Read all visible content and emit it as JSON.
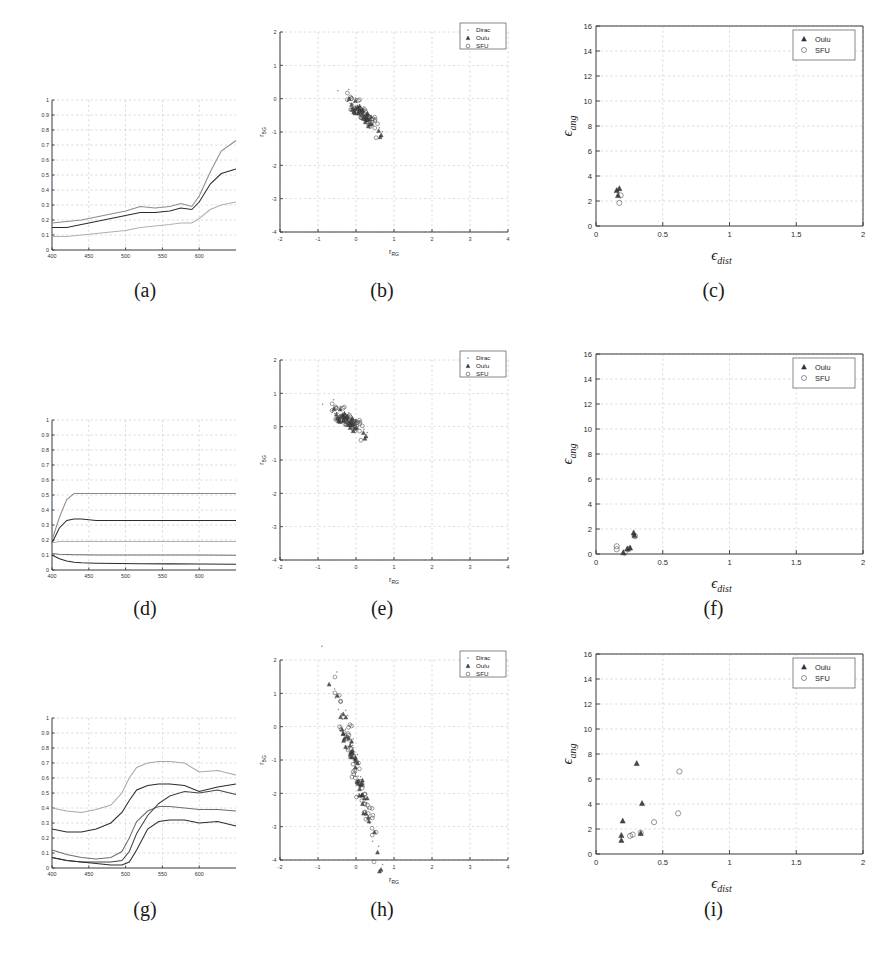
{
  "figure": {
    "rows": 3,
    "cols": 3,
    "captions": [
      "(a)",
      "(b)",
      "(c)",
      "(d)",
      "(e)",
      "(f)",
      "(g)",
      "(h)",
      "(i)"
    ]
  },
  "legends": {
    "scatter_rg": [
      {
        "label": "Dirac",
        "marker": "dot",
        "color": "#808080"
      },
      {
        "label": "Oulu",
        "marker": "triangle",
        "color": "#3a3a3a"
      },
      {
        "label": "SFU",
        "marker": "circle",
        "color": "#4a4a4a"
      }
    ],
    "scatter_eps": [
      {
        "label": "Oulu",
        "marker": "triangle",
        "color": "#3a3a3a"
      },
      {
        "label": "SFU",
        "marker": "circle",
        "color": "#4a4a4a"
      }
    ]
  },
  "axis_labels": {
    "spectral_x": "wavelength",
    "spectral_y": "reflectance",
    "rg_x": "r",
    "rg_x_sub": "RG",
    "rg_y": "r",
    "rg_y_sub": "BG",
    "eps_x": "ϵ",
    "eps_x_sub": "dist",
    "eps_y": "ϵ",
    "eps_y_sub": "ang"
  },
  "colors": {
    "axis": "#3a3a3a",
    "grid": "#9aa7c4",
    "curve_dark": "#2b2b2b",
    "curve_mid": "#6e6e6e",
    "curve_light": "#a8a8a8",
    "background": "#ffffff"
  },
  "chart_data": [
    {
      "id": "a",
      "type": "line",
      "title": "(a)",
      "xlabel": "wavelength (nm)",
      "ylabel": "reflectance",
      "xlim": [
        400,
        650
      ],
      "ylim": [
        0,
        1
      ],
      "xticks": [
        400,
        450,
        500,
        550,
        600
      ],
      "yticks": [
        0,
        0.1,
        0.2,
        0.3,
        0.4,
        0.5,
        0.6,
        0.7,
        0.8,
        0.9,
        1
      ],
      "grid": true,
      "x": [
        400,
        420,
        440,
        460,
        480,
        500,
        520,
        540,
        560,
        575,
        590,
        600,
        615,
        630,
        650
      ],
      "series": [
        {
          "name": "upper",
          "color": "#8c8c8c",
          "values": [
            0.18,
            0.19,
            0.2,
            0.22,
            0.24,
            0.26,
            0.29,
            0.28,
            0.29,
            0.31,
            0.29,
            0.36,
            0.52,
            0.66,
            0.73
          ]
        },
        {
          "name": "middle",
          "color": "#2b2b2b",
          "values": [
            0.15,
            0.15,
            0.17,
            0.19,
            0.21,
            0.23,
            0.25,
            0.25,
            0.26,
            0.28,
            0.27,
            0.32,
            0.44,
            0.51,
            0.54
          ]
        },
        {
          "name": "lower",
          "color": "#b0b0b0",
          "values": [
            0.09,
            0.09,
            0.1,
            0.11,
            0.12,
            0.13,
            0.15,
            0.16,
            0.17,
            0.18,
            0.18,
            0.21,
            0.27,
            0.3,
            0.32
          ]
        }
      ]
    },
    {
      "id": "b",
      "type": "scatter",
      "title": "(b)",
      "xlabel": "r_RG",
      "ylabel": "r_BG",
      "xlim": [
        -2,
        4
      ],
      "ylim": [
        -4,
        2
      ],
      "xticks": [
        -2,
        -1,
        0,
        1,
        2,
        3,
        4
      ],
      "yticks": [
        -4,
        -3,
        -2,
        -1,
        0,
        1,
        2
      ],
      "grid": true,
      "cluster": {
        "x_center": 0.18,
        "y_center": -0.45,
        "x_spread": 0.22,
        "y_spread": 0.33,
        "tilt": -1.25,
        "n_points": 120
      },
      "series": [
        {
          "name": "Dirac",
          "marker": "dot",
          "n": 40
        },
        {
          "name": "Oulu",
          "marker": "triangle",
          "n": 40
        },
        {
          "name": "SFU",
          "marker": "circle",
          "n": 40
        }
      ]
    },
    {
      "id": "c",
      "type": "scatter",
      "title": "(c)",
      "xlabel": "ϵ_dist",
      "ylabel": "ϵ_ang",
      "xlim": [
        0,
        2
      ],
      "ylim": [
        0,
        16
      ],
      "xticks": [
        0,
        0.5,
        1,
        1.5,
        2
      ],
      "yticks": [
        0,
        2,
        4,
        6,
        8,
        10,
        12,
        14,
        16
      ],
      "grid": true,
      "points": [
        {
          "series": "Oulu",
          "x": 0.175,
          "y": 3.0
        },
        {
          "series": "Oulu",
          "x": 0.165,
          "y": 2.45
        },
        {
          "series": "SFU",
          "x": 0.185,
          "y": 2.45
        },
        {
          "series": "SFU",
          "x": 0.175,
          "y": 1.85
        },
        {
          "series": "Oulu",
          "x": 0.155,
          "y": 2.85
        }
      ]
    },
    {
      "id": "d",
      "type": "line",
      "title": "(d)",
      "xlabel": "wavelength (nm)",
      "ylabel": "reflectance",
      "xlim": [
        400,
        650
      ],
      "ylim": [
        0,
        1
      ],
      "xticks": [
        400,
        450,
        500,
        550,
        600
      ],
      "yticks": [
        0,
        0.1,
        0.2,
        0.3,
        0.4,
        0.5,
        0.6,
        0.7,
        0.8,
        0.9,
        1
      ],
      "grid": true,
      "x": [
        400,
        410,
        420,
        430,
        440,
        460,
        490,
        520,
        560,
        600,
        650
      ],
      "series": [
        {
          "name": "s1",
          "color": "#8c8c8c",
          "values": [
            0.2,
            0.35,
            0.47,
            0.51,
            0.51,
            0.51,
            0.51,
            0.51,
            0.51,
            0.51,
            0.51
          ]
        },
        {
          "name": "s2",
          "color": "#2b2b2b",
          "values": [
            0.18,
            0.28,
            0.33,
            0.34,
            0.34,
            0.33,
            0.33,
            0.33,
            0.33,
            0.33,
            0.33
          ]
        },
        {
          "name": "s3",
          "color": "#b0b0b0",
          "values": [
            0.18,
            0.19,
            0.19,
            0.19,
            0.19,
            0.19,
            0.19,
            0.19,
            0.19,
            0.19,
            0.19
          ]
        },
        {
          "name": "s4",
          "color": "#6e6e6e",
          "values": [
            0.11,
            0.105,
            0.103,
            0.102,
            0.101,
            0.1,
            0.1,
            0.1,
            0.1,
            0.1,
            0.099
          ]
        },
        {
          "name": "s5",
          "color": "#2b2b2b",
          "values": [
            0.1,
            0.075,
            0.06,
            0.052,
            0.048,
            0.045,
            0.043,
            0.042,
            0.041,
            0.04,
            0.039
          ]
        }
      ]
    },
    {
      "id": "e",
      "type": "scatter",
      "title": "(e)",
      "xlabel": "r_RG",
      "ylabel": "r_BG",
      "xlim": [
        -2,
        4
      ],
      "ylim": [
        -4,
        2
      ],
      "xticks": [
        -2,
        -1,
        0,
        1,
        2,
        3,
        4
      ],
      "yticks": [
        -4,
        -3,
        -2,
        -1,
        0,
        1,
        2
      ],
      "grid": true,
      "cluster": {
        "x_center": -0.22,
        "y_center": 0.2,
        "x_spread": 0.22,
        "y_spread": 0.33,
        "tilt": -0.9,
        "n_points": 120
      },
      "series": [
        {
          "name": "Dirac",
          "marker": "dot",
          "n": 40
        },
        {
          "name": "Oulu",
          "marker": "triangle",
          "n": 40
        },
        {
          "name": "SFU",
          "marker": "circle",
          "n": 40
        }
      ]
    },
    {
      "id": "f",
      "type": "scatter",
      "title": "(f)",
      "xlabel": "ϵ_dist",
      "ylabel": "ϵ_ang",
      "xlim": [
        0,
        2
      ],
      "ylim": [
        0,
        16
      ],
      "xticks": [
        0,
        0.5,
        1,
        1.5,
        2
      ],
      "yticks": [
        0,
        2,
        4,
        6,
        8,
        10,
        12,
        14,
        16
      ],
      "grid": true,
      "points": [
        {
          "series": "SFU",
          "x": 0.155,
          "y": 0.62
        },
        {
          "series": "SFU",
          "x": 0.155,
          "y": 0.38
        },
        {
          "series": "Oulu",
          "x": 0.205,
          "y": 0.12
        },
        {
          "series": "SFU",
          "x": 0.215,
          "y": 0.1
        },
        {
          "series": "Oulu",
          "x": 0.235,
          "y": 0.42
        },
        {
          "series": "SFU",
          "x": 0.245,
          "y": 0.4
        },
        {
          "series": "Oulu",
          "x": 0.255,
          "y": 0.5
        },
        {
          "series": "Oulu",
          "x": 0.288,
          "y": 1.5
        },
        {
          "series": "SFU",
          "x": 0.292,
          "y": 1.42
        },
        {
          "series": "Oulu",
          "x": 0.282,
          "y": 1.7
        }
      ]
    },
    {
      "id": "g",
      "type": "line",
      "title": "(g)",
      "xlabel": "wavelength (nm)",
      "ylabel": "reflectance",
      "xlim": [
        400,
        650
      ],
      "ylim": [
        0,
        1
      ],
      "xticks": [
        400,
        450,
        500,
        550,
        600
      ],
      "yticks": [
        0,
        0.1,
        0.2,
        0.3,
        0.4,
        0.5,
        0.6,
        0.7,
        0.8,
        0.9,
        1
      ],
      "grid": true,
      "x": [
        400,
        420,
        440,
        460,
        480,
        495,
        505,
        515,
        530,
        545,
        560,
        580,
        600,
        625,
        650
      ],
      "series": [
        {
          "name": "g1",
          "color": "#a8a8a8",
          "values": [
            0.4,
            0.38,
            0.37,
            0.39,
            0.42,
            0.5,
            0.6,
            0.67,
            0.7,
            0.71,
            0.71,
            0.7,
            0.64,
            0.65,
            0.62
          ]
        },
        {
          "name": "g2",
          "color": "#2b2b2b",
          "values": [
            0.26,
            0.24,
            0.24,
            0.26,
            0.3,
            0.37,
            0.45,
            0.52,
            0.55,
            0.56,
            0.56,
            0.55,
            0.51,
            0.54,
            0.56
          ]
        },
        {
          "name": "g3",
          "color": "#6e6e6e",
          "values": [
            0.12,
            0.09,
            0.07,
            0.06,
            0.07,
            0.11,
            0.2,
            0.31,
            0.38,
            0.41,
            0.41,
            0.4,
            0.39,
            0.39,
            0.38
          ]
        },
        {
          "name": "g4",
          "color": "#444444",
          "values": [
            0.07,
            0.05,
            0.04,
            0.04,
            0.04,
            0.05,
            0.11,
            0.23,
            0.35,
            0.43,
            0.48,
            0.51,
            0.5,
            0.52,
            0.49
          ]
        },
        {
          "name": "g5",
          "color": "#2b2b2b",
          "values": [
            0.07,
            0.05,
            0.04,
            0.03,
            0.02,
            0.02,
            0.04,
            0.12,
            0.26,
            0.31,
            0.32,
            0.32,
            0.3,
            0.31,
            0.28
          ]
        }
      ]
    },
    {
      "id": "h",
      "type": "scatter",
      "title": "(h)",
      "xlabel": "r_RG",
      "ylabel": "r_BG",
      "xlim": [
        -2,
        4
      ],
      "ylim": [
        -4,
        2
      ],
      "xticks": [
        -2,
        -1,
        0,
        1,
        2,
        3,
        4
      ],
      "yticks": [
        -4,
        -3,
        -2,
        -1,
        0,
        1,
        2
      ],
      "grid": true,
      "cluster": {
        "x_center": 0.0,
        "y_center": -1.25,
        "x_spread": 0.3,
        "y_spread": 0.8,
        "tilt": -2.6,
        "n_points": 150
      },
      "series": [
        {
          "name": "Dirac",
          "marker": "dot",
          "n": 50
        },
        {
          "name": "Oulu",
          "marker": "triangle",
          "n": 50
        },
        {
          "name": "SFU",
          "marker": "circle",
          "n": 50
        }
      ]
    },
    {
      "id": "i",
      "type": "scatter",
      "title": "(i)",
      "xlabel": "ϵ_dist",
      "ylabel": "ϵ_ang",
      "xlim": [
        0,
        2
      ],
      "ylim": [
        0,
        16
      ],
      "xticks": [
        0,
        0.5,
        1,
        1.5,
        2
      ],
      "yticks": [
        0,
        2,
        4,
        6,
        8,
        10,
        12,
        14,
        16
      ],
      "grid": true,
      "points": [
        {
          "series": "Oulu",
          "x": 0.19,
          "y": 1.1
        },
        {
          "series": "Oulu",
          "x": 0.19,
          "y": 1.5
        },
        {
          "series": "Oulu",
          "x": 0.2,
          "y": 2.65
        },
        {
          "series": "SFU",
          "x": 0.255,
          "y": 1.45
        },
        {
          "series": "SFU",
          "x": 0.275,
          "y": 1.55
        },
        {
          "series": "Oulu",
          "x": 0.305,
          "y": 7.25
        },
        {
          "series": "Oulu",
          "x": 0.335,
          "y": 1.65
        },
        {
          "series": "SFU",
          "x": 0.335,
          "y": 1.7
        },
        {
          "series": "Oulu",
          "x": 0.345,
          "y": 4.05
        },
        {
          "series": "SFU",
          "x": 0.435,
          "y": 2.55
        },
        {
          "series": "SFU",
          "x": 0.615,
          "y": 3.25
        },
        {
          "series": "SFU",
          "x": 0.625,
          "y": 6.6
        }
      ]
    }
  ]
}
